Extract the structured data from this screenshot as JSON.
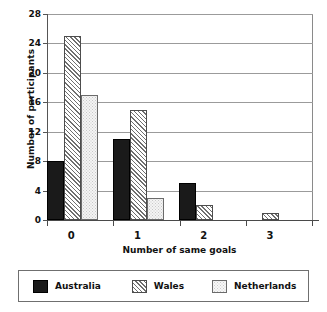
{
  "chart_data": {
    "type": "bar",
    "title": "",
    "xlabel": "Number of same goals",
    "ylabel": "Number of participants",
    "categories": [
      "0",
      "1",
      "2",
      "3"
    ],
    "series": [
      {
        "name": "Australia",
        "values": [
          8,
          11,
          5,
          0
        ]
      },
      {
        "name": "Wales",
        "values": [
          25,
          15,
          2,
          1
        ]
      },
      {
        "name": "Netherlands",
        "values": [
          17,
          3,
          0,
          0
        ]
      }
    ],
    "ylim": [
      0,
      28
    ],
    "yticks": [
      0,
      4,
      8,
      12,
      16,
      20,
      24,
      28
    ],
    "ytick_labels": [
      "0",
      "4",
      "8",
      "12",
      "16",
      "20",
      "24",
      "28"
    ],
    "grid": true,
    "legend_position": "below",
    "colors": {
      "australia": "#1a1a1a",
      "wales": "#6f6f6f",
      "netherlands": "#f4f4f4",
      "gridline": "#9b9b9b",
      "axis": "#4a4a4a",
      "background": "#ffffff"
    }
  },
  "legend": {
    "entries": [
      {
        "label": "Australia",
        "pattern": "solid-black-swatch"
      },
      {
        "label": "Wales",
        "pattern": "diagonal-hatch-swatch"
      },
      {
        "label": "Netherlands",
        "pattern": "light-dotted-swatch"
      }
    ]
  }
}
